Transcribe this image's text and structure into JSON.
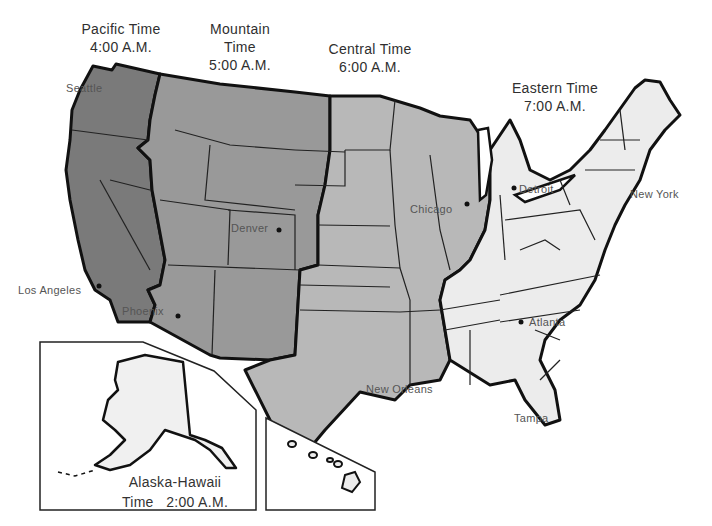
{
  "map": {
    "type": "time-zone map",
    "colors": {
      "pacific": "#7a7a7a",
      "mountain": "#999999",
      "central": "#b8b8b8",
      "eastern": "#ececec",
      "alaska_hawaii": "#f0f0f0",
      "border": "#111111",
      "background": "#ffffff"
    }
  },
  "zones": {
    "pacific": {
      "line1": "Pacific Time",
      "line2": "4:00 A.M."
    },
    "mountain": {
      "line1": "Mountain",
      "line2": "Time",
      "line3": "5:00 A.M."
    },
    "central": {
      "line1": "Central Time",
      "line2": "6:00 A.M."
    },
    "eastern": {
      "line1": "Eastern Time",
      "line2": "7:00 A.M."
    },
    "alaska_hawaii": {
      "line1": "Alaska-Hawaii",
      "line2": "Time   2:00 A.M."
    }
  },
  "cities": [
    {
      "name": "Seattle"
    },
    {
      "name": "Los Angeles"
    },
    {
      "name": "Phoenix"
    },
    {
      "name": "Denver"
    },
    {
      "name": "Chicago"
    },
    {
      "name": "Detroit"
    },
    {
      "name": "New York"
    },
    {
      "name": "Atlanta"
    },
    {
      "name": "New Orleans"
    },
    {
      "name": "Tampa"
    }
  ]
}
